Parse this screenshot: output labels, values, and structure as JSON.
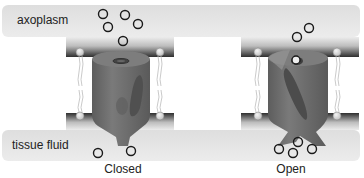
{
  "regions": {
    "top_label": "axoplasm",
    "bottom_label": "tissue fluid"
  },
  "channels": [
    {
      "id": "closed",
      "caption": "Closed"
    },
    {
      "id": "open",
      "caption": "Open"
    }
  ],
  "colors": {
    "fluid_band": "#e4e4e4",
    "membrane_dark": "#3a3a3a",
    "membrane_light": "#e8e8e8",
    "channel_body": "#6e6e6e",
    "channel_gate": "#4a4a4a",
    "ion_stroke": "#1a1a1a",
    "ion_fill": "#f2f2f2"
  }
}
